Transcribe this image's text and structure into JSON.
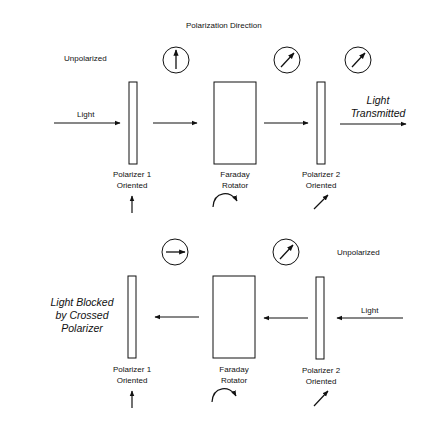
{
  "title": "Polarization Direction",
  "top": {
    "unpolarized_label": "Unpolarized",
    "light_label": "Light",
    "transmitted_label_1": "Light",
    "transmitted_label_2": "Transmitted",
    "polarizer1": {
      "line1": "Polarizer 1",
      "line2": "Oriented",
      "orientation": "vertical-arrow"
    },
    "rotator": {
      "line1": "Faraday",
      "line2": "Rotator",
      "rotation": "clockwise-arc-arrow"
    },
    "polarizer2": {
      "line1": "Polarizer 2",
      "line2": "Oriented",
      "orientation": "diagonal-45-arrow"
    },
    "polarization_circles": [
      "up-arrow",
      "diagonal-arrow",
      "diagonal-arrow"
    ]
  },
  "bottom": {
    "unpolarized_label": "Unpolarized",
    "light_label": "Light",
    "blocked_label_1": "Light Blocked",
    "blocked_label_2": "by Crossed",
    "blocked_label_3": "Polarizer",
    "polarizer1": {
      "line1": "Polarizer 1",
      "line2": "Oriented",
      "orientation": "vertical-arrow"
    },
    "rotator": {
      "line1": "Faraday",
      "line2": "Rotator",
      "rotation": "clockwise-arc-arrow"
    },
    "polarizer2": {
      "line1": "Polarizer 2",
      "line2": "Oriented",
      "orientation": "diagonal-45-arrow"
    },
    "polarization_circles": [
      "right-arrow",
      "diagonal-arrow"
    ]
  }
}
